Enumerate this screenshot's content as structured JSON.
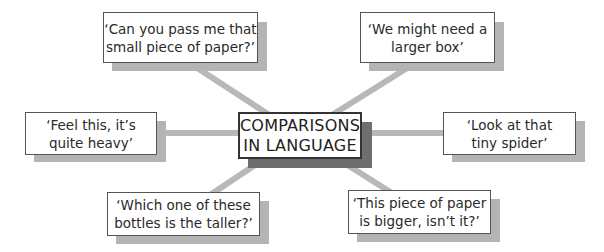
{
  "diagram": {
    "type": "spider-diagram",
    "center": {
      "line1": "COMPARISONS",
      "line2": "IN LANGUAGE"
    },
    "nodes": [
      {
        "position": "top-left",
        "line1": "‘Can you pass me that",
        "line2": "small piece of paper?’"
      },
      {
        "position": "top-right",
        "line1": "‘We might need a",
        "line2": "larger box’"
      },
      {
        "position": "middle-left",
        "line1": "‘Feel this, it’s",
        "line2": "quite heavy’"
      },
      {
        "position": "middle-right",
        "line1": "‘Look at that",
        "line2": "tiny spider’"
      },
      {
        "position": "bottom-left",
        "line1": "‘Which one of these",
        "line2": "bottles is the taller?’"
      },
      {
        "position": "bottom-right",
        "line1": "‘This piece of paper",
        "line2": "is bigger, isn’t it?’"
      }
    ],
    "colors": {
      "connector": "#b4b4b4",
      "center_shadow": "#6e6e6e",
      "node_shadow": "#b4b4b4",
      "border": "#555555"
    }
  }
}
